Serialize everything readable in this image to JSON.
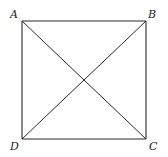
{
  "figure": {
    "type": "square-with-diagonals",
    "vertices": [
      {
        "id": "A",
        "label": "A",
        "position": "top-left"
      },
      {
        "id": "B",
        "label": "B",
        "position": "top-right"
      },
      {
        "id": "C",
        "label": "C",
        "position": "bottom-right"
      },
      {
        "id": "D",
        "label": "D",
        "position": "bottom-left"
      }
    ],
    "sides": [
      [
        "A",
        "B"
      ],
      [
        "B",
        "C"
      ],
      [
        "C",
        "D"
      ],
      [
        "D",
        "A"
      ]
    ],
    "diagonals": [
      [
        "A",
        "C"
      ],
      [
        "B",
        "D"
      ]
    ]
  }
}
